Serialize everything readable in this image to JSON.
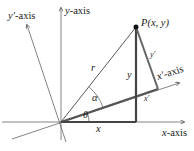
{
  "diagram": {
    "type": "coordinate-rotation",
    "labels": {
      "y_axis": "y-axis",
      "y_prime_axis": "y′-axis",
      "x_axis": "x-axis",
      "x_prime_axis": "x′-axis",
      "point": "P(x, y)",
      "r": "r",
      "alpha": "α",
      "theta": "θ",
      "x": "x",
      "y": "y",
      "x_prime": "x′",
      "y_prime": "y′"
    },
    "colors": {
      "axis": "#555555",
      "heavy": "#444444",
      "rotated_line": "#777777",
      "text": "#222222"
    }
  }
}
